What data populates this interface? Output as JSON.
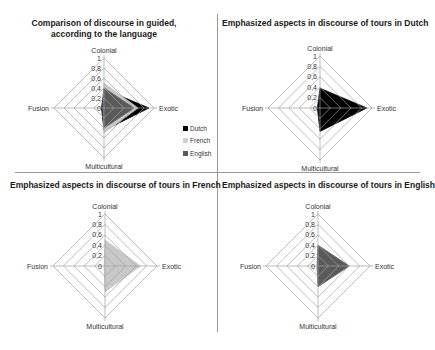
{
  "axes": [
    "Colonial",
    "Exotic",
    "Multicultural",
    "Fusion"
  ],
  "ticks": [
    "0",
    "0,2",
    "0,4",
    "0,6",
    "0,8",
    "1"
  ],
  "colors": {
    "Dutch": "#000000",
    "French": "#c8c8c8",
    "English": "#5a5a5a",
    "grid": "#a0a0a0"
  },
  "legend": [
    {
      "label": "Dutch",
      "color": "#000000"
    },
    {
      "label": "French",
      "color": "#d0d0d0"
    },
    {
      "label": "English",
      "color": "#5a5a5a"
    }
  ],
  "charts": [
    {
      "title_line1": "Comparison of discourse in guided,",
      "title_line2": "according to the language"
    },
    {
      "title": "Emphasized aspects in discourse of tours in Dutch"
    },
    {
      "title": "Emphasized aspects in discourse of tours in French"
    },
    {
      "title": "Emphasized aspects in discourse of tours in English"
    }
  ],
  "chart_data": [
    {
      "type": "radar",
      "title": "Comparison of discourse in guided, according to the language",
      "categories": [
        "Colonial",
        "Exotic",
        "Multicultural",
        "Fusion"
      ],
      "series": [
        {
          "name": "Dutch",
          "values": [
            0.38,
            0.9,
            0.45,
            0.05
          ]
        },
        {
          "name": "French",
          "values": [
            0.5,
            0.68,
            0.5,
            0.0
          ]
        },
        {
          "name": "English",
          "values": [
            0.4,
            0.6,
            0.4,
            0.0
          ]
        }
      ],
      "rlim": [
        0,
        1
      ],
      "ticks": [
        0,
        0.2,
        0.4,
        0.6,
        0.8,
        1
      ],
      "legend_position": "right"
    },
    {
      "type": "radar",
      "title": "Emphasized aspects in discourse of tours in Dutch",
      "categories": [
        "Colonial",
        "Exotic",
        "Multicultural",
        "Fusion"
      ],
      "series": [
        {
          "name": "Dutch",
          "values": [
            0.38,
            0.9,
            0.45,
            0.05
          ]
        }
      ],
      "rlim": [
        0,
        1
      ]
    },
    {
      "type": "radar",
      "title": "Emphasized aspects in discourse of tours in French",
      "categories": [
        "Colonial",
        "Exotic",
        "Multicultural",
        "Fusion"
      ],
      "series": [
        {
          "name": "French",
          "values": [
            0.5,
            0.68,
            0.5,
            0.0
          ]
        }
      ],
      "rlim": [
        0,
        1
      ]
    },
    {
      "type": "radar",
      "title": "Emphasized aspects in discourse of tours in English",
      "categories": [
        "Colonial",
        "Exotic",
        "Multicultural",
        "Fusion"
      ],
      "series": [
        {
          "name": "English",
          "values": [
            0.4,
            0.6,
            0.4,
            0.0
          ]
        }
      ],
      "rlim": [
        0,
        1
      ]
    }
  ]
}
